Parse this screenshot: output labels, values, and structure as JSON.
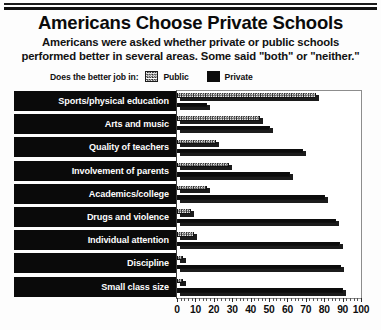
{
  "header": {
    "title": "Americans Choose Private Schools",
    "subtitle_line1": "Americans were asked whether private or public schools",
    "subtitle_line2": "performed better in several areas. Some said \"both\" or \"neither.\""
  },
  "legend": {
    "prompt": "Does the better job in:",
    "public_label": "Public",
    "private_label": "Private",
    "public_color": "#ffffff",
    "private_color": "#0d0d0d"
  },
  "chart_data": {
    "type": "bar",
    "orientation": "horizontal",
    "title": "Americans Choose Private Schools",
    "xlabel": "",
    "ylabel": "",
    "xlim": [
      0,
      100
    ],
    "xticks": [
      0,
      10,
      20,
      30,
      40,
      50,
      60,
      70,
      80,
      90,
      100
    ],
    "grid": false,
    "legend_position": "top",
    "categories": [
      "Sports/physical education",
      "Arts and music",
      "Quality of teachers",
      "Involvement of parents",
      "Academics/college",
      "Drugs and violence",
      "Individual attention",
      "Discipline",
      "Small class size"
    ],
    "series": [
      {
        "name": "Public",
        "values": [
          77,
          47,
          23,
          30,
          18,
          9,
          11,
          5,
          5
        ]
      },
      {
        "name": "Private",
        "values": [
          18,
          52,
          70,
          63,
          82,
          88,
          90,
          91,
          92
        ]
      }
    ]
  }
}
